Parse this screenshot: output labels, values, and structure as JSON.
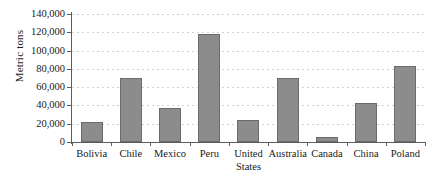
{
  "chart_data": {
    "type": "bar",
    "title": "",
    "subtitle": "",
    "xlabel": "",
    "ylabel": "Metric tons",
    "categories": [
      "Bolivia",
      "Chile",
      "Mexico",
      "Peru",
      "United States",
      "Australia",
      "Canada",
      "China",
      "Poland"
    ],
    "category_lines": [
      [
        "Bolivia"
      ],
      [
        "Chile"
      ],
      [
        "Mexico"
      ],
      [
        "Peru"
      ],
      [
        "United",
        "States"
      ],
      [
        "Australia"
      ],
      [
        "Canada"
      ],
      [
        "China"
      ],
      [
        "Poland"
      ]
    ],
    "values": [
      22000,
      70000,
      37000,
      118000,
      24000,
      70000,
      6000,
      43000,
      83000
    ],
    "ylim": [
      0,
      140000
    ],
    "ytick_values": [
      0,
      20000,
      40000,
      60000,
      80000,
      100000,
      120000,
      140000
    ],
    "ytick_labels": [
      "0",
      "20,000",
      "40,000",
      "60,000",
      "80,000",
      "100,000",
      "120,000",
      "140,000"
    ],
    "grid": true,
    "grid_axis": "y",
    "grid_style": "dotted",
    "legend": false,
    "legend_position": "none",
    "bar_color": "#8c8c8c",
    "bar_border_color": "#6b6b6b",
    "grid_color": "#c9c9c9",
    "axis_color": "#5d5d5d",
    "text_color": "#1a1a1a",
    "background_color": "#ffffff"
  }
}
